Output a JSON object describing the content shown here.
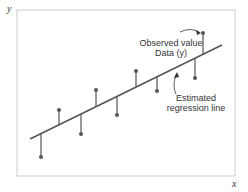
{
  "diagram": {
    "axes": {
      "x_label": "x",
      "y_label": "y"
    },
    "annotations": {
      "observed": {
        "line1": "Observed value",
        "line2": "Data (y)"
      },
      "regression": {
        "line1": "Estimated",
        "line2": "regression line"
      }
    },
    "colors": {
      "frame": "#cccccc",
      "line": "#555555",
      "point": "#555555"
    },
    "regression_line": {
      "x1": 30,
      "y1": 139,
      "x2": 222,
      "y2": 45
    },
    "points": [
      {
        "x": 41,
        "y": 157
      },
      {
        "x": 59,
        "y": 110
      },
      {
        "x": 81,
        "y": 134
      },
      {
        "x": 96,
        "y": 90
      },
      {
        "x": 117,
        "y": 115
      },
      {
        "x": 136,
        "y": 71
      },
      {
        "x": 157,
        "y": 91
      },
      {
        "x": 195,
        "y": 78
      },
      {
        "x": 203,
        "y": 33
      }
    ]
  }
}
